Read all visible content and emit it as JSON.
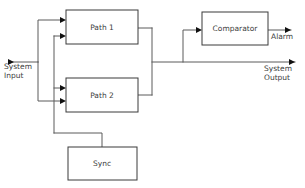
{
  "diagram": {
    "background_color": "#ffffff",
    "line_color": "#5a5a5a",
    "box_stroke_color": "#3a3a3a",
    "text_color": "#3d3d3d",
    "blocks": [
      {
        "id": "path1",
        "label": "Path 1",
        "x": 66,
        "y": 10,
        "width": 72,
        "height": 34,
        "label_x": 102,
        "label_y": 28
      },
      {
        "id": "path2",
        "label": "Path 2",
        "x": 66,
        "y": 78,
        "width": 72,
        "height": 34,
        "label_x": 102,
        "label_y": 96
      },
      {
        "id": "sync",
        "label": "Sync",
        "x": 68,
        "y": 147,
        "width": 69,
        "height": 33,
        "label_x": 102,
        "label_y": 164
      },
      {
        "id": "comparator",
        "label": "Comparator",
        "x": 202,
        "y": 12,
        "width": 66,
        "height": 33,
        "label_x": 235,
        "label_y": 29
      }
    ],
    "labels": [
      {
        "id": "system-input",
        "lines": [
          "System",
          "Input"
        ],
        "x": 4,
        "y": 69,
        "line_height": 9,
        "align": "start"
      },
      {
        "id": "alarm",
        "lines": [
          "Alarm"
        ],
        "x": 271,
        "y": 39,
        "line_height": 9,
        "align": "start"
      },
      {
        "id": "system-output",
        "lines": [
          "System",
          "Output"
        ],
        "x": 264,
        "y": 71,
        "line_height": 9,
        "align": "start"
      }
    ],
    "wires": [
      {
        "id": "input-trunk",
        "d": "M 10 62 L 38 62"
      },
      {
        "id": "split-bus-a",
        "d": "M 38 62 L 38 20 L 62 20"
      },
      {
        "id": "split-bus-a-lower",
        "d": "M 38 62 L 38 101 L 62 101"
      },
      {
        "id": "split-bus-b",
        "d": "M 54 36 L 62 36"
      },
      {
        "id": "split-bus-b-vert",
        "d": "M 54 36 L 54 133"
      },
      {
        "id": "split-bus-b-lower",
        "d": "M 54 88 L 62 88"
      },
      {
        "id": "sync-feed",
        "d": "M 54 133 L 102 133 L 102 147"
      },
      {
        "id": "path1-out",
        "d": "M 138 28 L 152 28"
      },
      {
        "id": "path2-out",
        "d": "M 138 95 L 152 95"
      },
      {
        "id": "merge-bus",
        "d": "M 152 28 L 152 95"
      },
      {
        "id": "output-trunk",
        "d": "M 152 62 L 295 62"
      },
      {
        "id": "comparator-tap",
        "d": "M 183 62 L 183 30 L 198 30"
      },
      {
        "id": "alarm-out",
        "d": "M 268 30 L 291 30"
      }
    ],
    "arrows": [
      {
        "id": "arrow-input",
        "x": 14,
        "y": 62,
        "dir": "right"
      },
      {
        "id": "arrow-path1-in-a",
        "x": 66,
        "y": 20,
        "dir": "right"
      },
      {
        "id": "arrow-path1-in-b",
        "x": 66,
        "y": 36,
        "dir": "right"
      },
      {
        "id": "arrow-path2-in-a",
        "x": 66,
        "y": 88,
        "dir": "right"
      },
      {
        "id": "arrow-path2-in-b",
        "x": 66,
        "y": 101,
        "dir": "right"
      },
      {
        "id": "arrow-comparator",
        "x": 202,
        "y": 30,
        "dir": "right"
      },
      {
        "id": "arrow-alarm",
        "x": 291,
        "y": 30,
        "dir": "right"
      },
      {
        "id": "arrow-output",
        "x": 295,
        "y": 62,
        "dir": "right"
      }
    ]
  }
}
